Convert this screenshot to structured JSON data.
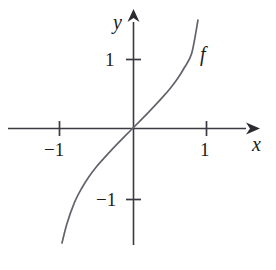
{
  "figure": {
    "background_color": "#ffffff",
    "ink_color": "#3a3a42",
    "text_color": "#1c1c20"
  },
  "axes": {
    "x_axis_label": "x",
    "y_axis_label": "y",
    "x_axis": {
      "pixel_y": 128,
      "pixel_start_x": 8,
      "pixel_end_x": 253,
      "arrow": "right-arrow",
      "ticks": [
        {
          "value": -1,
          "label": "−1",
          "pixel_x": 59
        },
        {
          "value": 1,
          "label": "1",
          "pixel_x": 206
        }
      ]
    },
    "y_axis": {
      "pixel_x": 133,
      "pixel_start_y": 245,
      "pixel_end_y": 12,
      "arrow": "up-arrow",
      "ticks": [
        {
          "value": 1,
          "label": "1",
          "pixel_y": 59
        },
        {
          "value": -1,
          "label": "−1",
          "pixel_y": 199
        }
      ]
    },
    "origin": {
      "pixel_x": 133,
      "pixel_y": 128
    },
    "unit_px_x": 73.5,
    "unit_px_y": 69.5
  },
  "curve": {
    "name": "f",
    "label": "f",
    "label_position": {
      "pixel_x": 200,
      "pixel_y": 44
    }
  },
  "chart_data": {
    "type": "line",
    "title": "",
    "subtitle": "",
    "xlabel": "x",
    "ylabel": "y",
    "grid": false,
    "legend": "none",
    "annotations": [
      {
        "text": "f",
        "x": 0.91,
        "y": 1.22
      }
    ],
    "xlim": [
      -1.7,
      1.63
    ],
    "ylim": [
      -1.68,
      1.67
    ],
    "xticks": [
      -1,
      1
    ],
    "xticklabels": [
      "−1",
      "1"
    ],
    "yticks": [
      -1,
      1
    ],
    "yticklabels": [
      "−1",
      "1"
    ],
    "series": [
      {
        "name": "f",
        "x": [
          -0.966,
          -0.9,
          -0.8,
          -0.7,
          -0.6,
          -0.5,
          -0.4,
          -0.3,
          -0.2,
          -0.1,
          0.0,
          0.1,
          0.2,
          0.3,
          0.4,
          0.5,
          0.6,
          0.7,
          0.8,
          0.884
        ],
        "y": [
          -1.655,
          -1.38,
          -1.08,
          -0.87,
          -0.7,
          -0.56,
          -0.44,
          -0.325,
          -0.215,
          -0.107,
          0.0,
          0.107,
          0.215,
          0.325,
          0.44,
          0.56,
          0.7,
          0.87,
          1.08,
          1.554
        ]
      }
    ]
  }
}
